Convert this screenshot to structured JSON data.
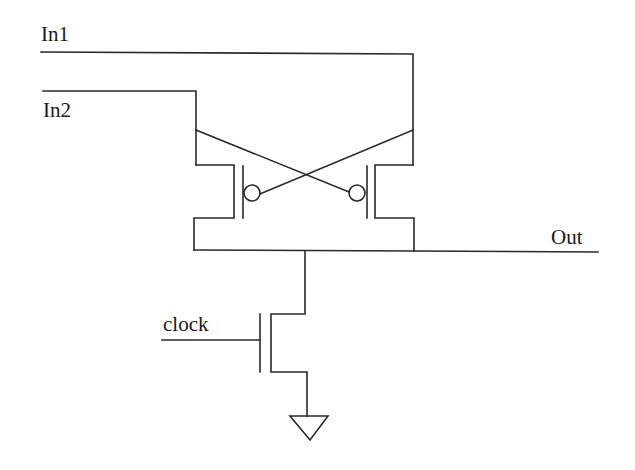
{
  "diagram": {
    "type": "circuit-schematic",
    "labels": {
      "in1": "In1",
      "in2": "In2",
      "out": "Out",
      "clock": "clock"
    },
    "components": [
      {
        "id": "pmos-left",
        "type": "pmos-transistor",
        "gate_bubble": true
      },
      {
        "id": "pmos-right",
        "type": "pmos-transistor",
        "gate_bubble": true
      },
      {
        "id": "nmos-clock",
        "type": "nmos-transistor",
        "gate": "clock"
      },
      {
        "id": "ground",
        "type": "ground-symbol"
      }
    ],
    "colors": {
      "wire": "#2a2a2a",
      "background": "#ffffff"
    }
  }
}
